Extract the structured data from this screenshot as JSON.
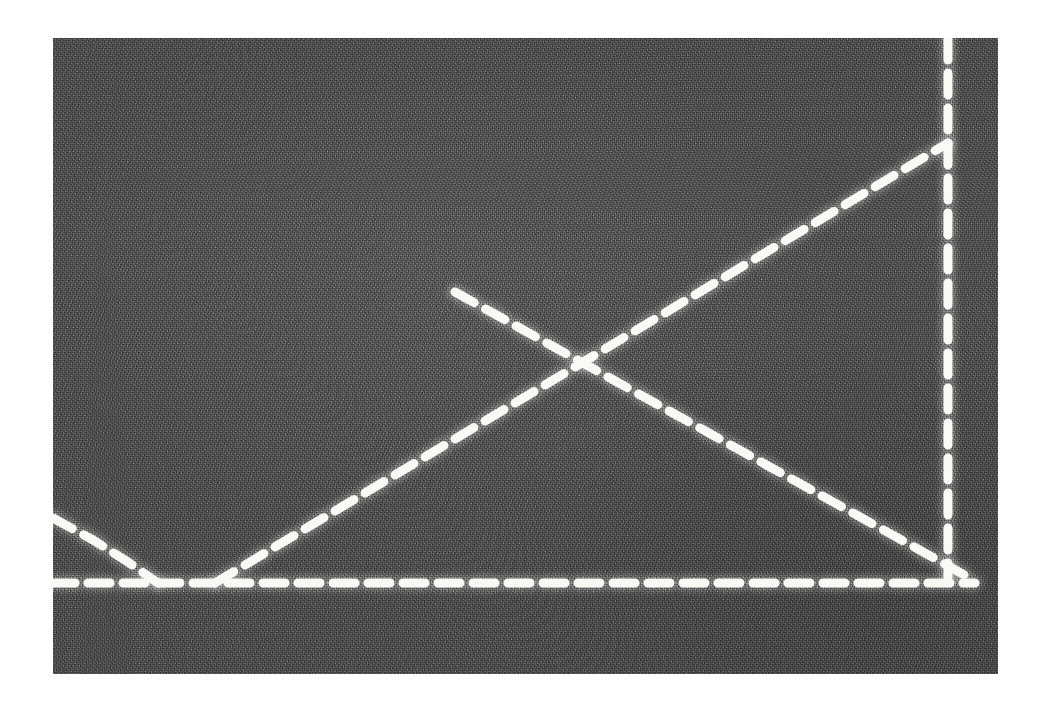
{
  "image": {
    "title": "Oscilloscope screen photograph",
    "medium": "photograph of a CRT display",
    "caption": "Dashed white traces on a grainy grey screen",
    "width": 1046,
    "height": 705
  },
  "frame": {
    "border_color": "#ffffff",
    "panel_color": "#5a5a5a",
    "trace_color": "#fbfbf7",
    "graticule_color": "#dcdcdc",
    "panel_left": 53,
    "panel_top": 38,
    "panel_width": 945,
    "panel_height": 636
  },
  "chart_data": {
    "type": "line",
    "subtitle": "",
    "xlabel": "",
    "ylabel": "",
    "xlim": [
      0,
      945
    ],
    "ylim": [
      636,
      0
    ],
    "grid": true,
    "legend": "none",
    "axis_ticks": [],
    "tick_labels": [],
    "annotations": [],
    "style": {
      "dash_length": 22,
      "dash_gap": 13,
      "stroke_width": 9
    },
    "series": [
      {
        "name": "baseline",
        "label": "Horizontal dashed baseline",
        "dash": [
          22,
          13
        ],
        "points": [
          [
            0,
            545
          ],
          [
            922,
            545
          ]
        ]
      },
      {
        "name": "rising-ramp",
        "label": "Rising diagonal ramp",
        "dash": [
          22,
          13
        ],
        "points": [
          [
            162,
            545
          ],
          [
            895,
            105
          ]
        ]
      },
      {
        "name": "falling-ramp",
        "label": "Falling diagonal ramp",
        "dash": [
          22,
          13
        ],
        "points": [
          [
            402,
            254
          ],
          [
            917,
            540
          ]
        ]
      },
      {
        "name": "right-edge-drop",
        "label": "Vertical dashed edge on the right",
        "dash": [
          22,
          13
        ],
        "points": [
          [
            895,
            0
          ],
          [
            895,
            540
          ]
        ]
      },
      {
        "name": "left-decay",
        "label": "Left-hand decaying curve to baseline",
        "dash": [
          22,
          13
        ],
        "points": [
          [
            0,
            480
          ],
          [
            40,
            502
          ],
          [
            75,
            524
          ],
          [
            105,
            545
          ]
        ]
      }
    ],
    "graticule_lines": [
      {
        "name": "vertical-graticule",
        "orientation": "vertical",
        "x": 505
      }
    ]
  }
}
